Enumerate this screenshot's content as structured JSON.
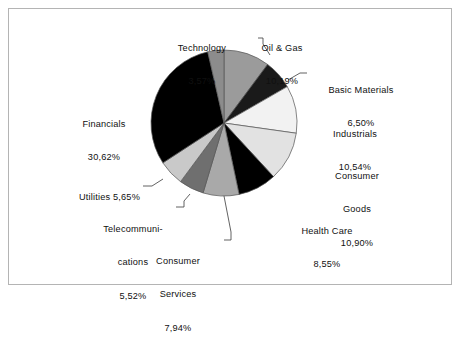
{
  "figure": {
    "border_color": "#b4b4b4",
    "background": "#ffffff"
  },
  "chart_data": {
    "type": "pie",
    "title": "",
    "subtitle": "",
    "xlabel": "",
    "ylabel": "",
    "legend_position": "callout-labels",
    "grid": false,
    "decimal_separator": ",",
    "value_suffix": "%",
    "start_angle_deg": 0,
    "direction": "clockwise",
    "center": {
      "x": 224,
      "y": 123
    },
    "radius": 73,
    "categories": [
      "Oil & Gas",
      "Basic Materials",
      "Industrials",
      "Consumer Goods",
      "Health Care",
      "Consumer Services",
      "Telecommunications",
      "Utilities",
      "Financials",
      "Technology"
    ],
    "values": [
      10.19,
      6.5,
      10.54,
      10.9,
      8.55,
      7.94,
      5.52,
      5.65,
      30.62,
      3.57
    ],
    "value_labels": [
      "10,19%",
      "6,50%",
      "10,54%",
      "10,90%",
      "8,55%",
      "7,94%",
      "5,52%",
      "5,65%",
      "30,62%",
      "3,57%"
    ],
    "colors": [
      "#9b9b9b",
      "#1a1a1a",
      "#f2f2f2",
      "#e2e2e2",
      "#000000",
      "#a9a9a9",
      "#6f6f6f",
      "#c9c9c9",
      "#000000",
      "#8c8c8c"
    ],
    "slice_edge_color": "#555555",
    "total": 100.0
  },
  "labels": {
    "technology": {
      "name": "Technology",
      "value": "3,57%"
    },
    "oil_gas": {
      "name": "Oil & Gas",
      "value": "10,19%"
    },
    "basic_materials": {
      "name": "Basic Materials",
      "value": "6,50%"
    },
    "industrials": {
      "name": "Industrials",
      "value": "10,54%"
    },
    "consumer_goods": {
      "name": "Consumer",
      "name2": "Goods",
      "value": "10,90%"
    },
    "health_care": {
      "name": "Health Care",
      "value": "8,55%"
    },
    "consumer_services": {
      "name": "Consumer",
      "name2": "Services",
      "value": "7,94%"
    },
    "telecommunications": {
      "name": "Telecommuni-",
      "name2": "cations",
      "value": "5,52%"
    },
    "utilities": {
      "name": "Utilities",
      "value": "5,65%"
    },
    "financials": {
      "name": "Financials",
      "value": "30,62%"
    }
  }
}
